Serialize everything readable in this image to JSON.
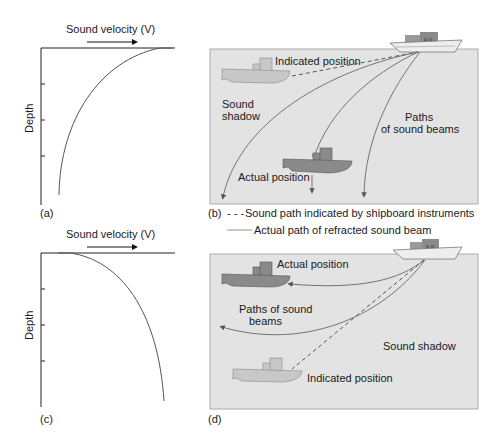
{
  "panels": {
    "a": {
      "label": "(a)",
      "title": "Sound velocity (V)",
      "ylabel": "Depth"
    },
    "b": {
      "label": "(b)",
      "indicated_position": "Indicated position",
      "sound_shadow_1": "Sound",
      "sound_shadow_2": "shadow",
      "paths_1": "Paths",
      "paths_2": "of sound beams",
      "actual_position": "Actual position"
    },
    "c": {
      "label": "(c)",
      "title": "Sound velocity (V)",
      "ylabel": "Depth"
    },
    "d": {
      "label": "(d)",
      "actual_position": "Actual position",
      "paths_1": "Paths of sound",
      "paths_2": "beams",
      "sound_shadow": "Sound shadow",
      "indicated_position": "Indicated position"
    }
  },
  "legend": {
    "dashed_marker": "- - -",
    "dashed_label": "Sound path indicated by shipboard instruments",
    "solid_label": "Actual path of refracted sound beam"
  },
  "colors": {
    "water": "#e3e3e3",
    "ship_light": "#c8c8c8",
    "ship_dark": "#8a8a8a",
    "line": "#555555"
  }
}
